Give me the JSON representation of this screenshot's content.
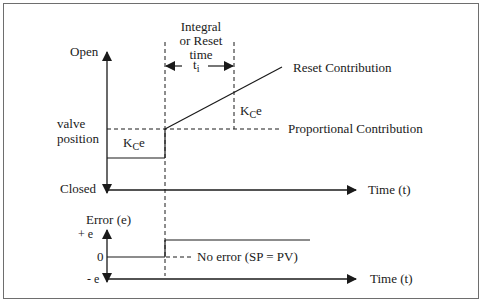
{
  "figure": {
    "top_plot": {
      "y_axis_top_label": "Open",
      "y_axis_bottom_label": "Closed",
      "y_axis_mid_label_line1": "valve",
      "y_axis_mid_label_line2": "position",
      "x_axis_label": "Time (t)",
      "integral_time_label_line1": "Integral",
      "integral_time_label_line2": "or Reset",
      "integral_time_label_line3": "time",
      "integral_time_symbol": "t",
      "integral_time_subscript": "i",
      "step_label_K": "K",
      "step_label_sub": "C",
      "step_label_e": "e",
      "reset_step_label_K": "K",
      "reset_step_label_sub": "C",
      "reset_step_label_e": "e",
      "reset_contribution_label": "Reset Contribution",
      "proportional_contribution_label": "Proportional Contribution"
    },
    "bottom_plot": {
      "y_axis_title": "Error (e)",
      "y_tick_plus": "+ e",
      "y_tick_zero": "0",
      "y_tick_minus": "- e",
      "no_error_label": "No error (SP = PV)",
      "x_axis_label": "Time (t)"
    },
    "colors": {
      "line": "#1a1a1a",
      "border": "#6e6e6e",
      "background": "#ffffff"
    }
  }
}
